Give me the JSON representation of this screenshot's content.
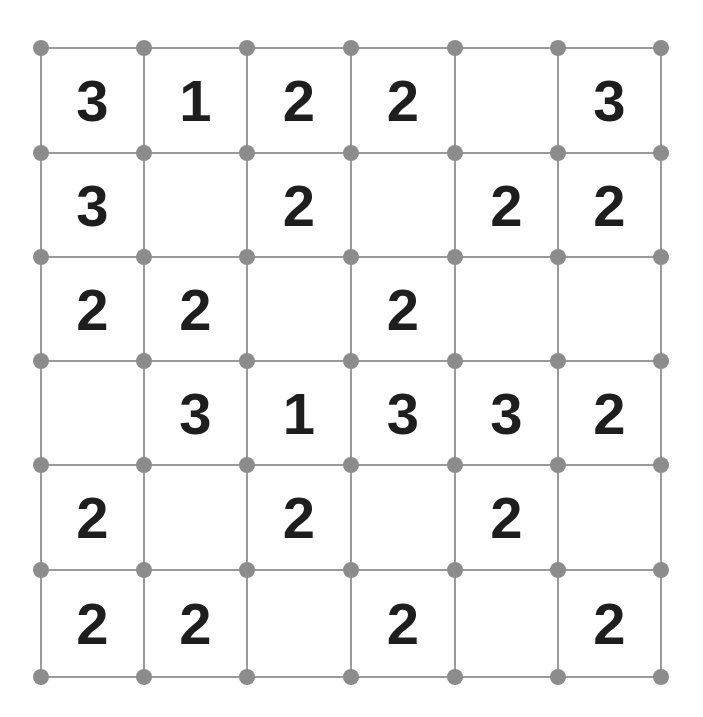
{
  "puzzle": {
    "type": "slitherlink",
    "rows": 6,
    "cols": 6,
    "clues": [
      [
        "3",
        "1",
        "2",
        "2",
        "",
        "3"
      ],
      [
        "3",
        "",
        "2",
        "",
        "2",
        "2"
      ],
      [
        "2",
        "2",
        "",
        "2",
        "",
        ""
      ],
      [
        "",
        "3",
        "1",
        "3",
        "3",
        "2"
      ],
      [
        "2",
        "",
        "2",
        "",
        "2",
        ""
      ],
      [
        "2",
        "2",
        "",
        "2",
        "",
        "2"
      ]
    ]
  },
  "colors": {
    "line": "#9a9a9a",
    "dot": "#8c8c8c",
    "clue_text": "#1e1e1e",
    "background": "#ffffff"
  }
}
